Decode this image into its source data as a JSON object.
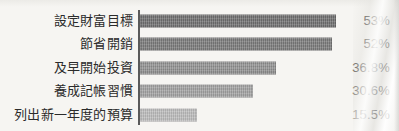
{
  "chart_data": {
    "type": "bar",
    "orientation": "horizontal",
    "title": "",
    "subtitle": "",
    "xlabel": "",
    "ylabel": "",
    "grid": false,
    "legend": null,
    "xlim": [
      0,
      55
    ],
    "axis_line": "vertical baseline at zero",
    "categories": [
      "設定財富目標",
      "節省開銷",
      "及早開始投資",
      "養成記帳習慣",
      "列出新一年度的預算"
    ],
    "values": [
      53,
      52,
      36.8,
      30.6,
      15.5
    ],
    "value_labels": [
      "53%",
      "52%",
      "36.8%",
      "30.6%",
      "15.5%"
    ],
    "bar_colors": [
      "#6f6f6f",
      "#7b7b7b",
      "#8e8e8e",
      "#a2a2a2",
      "#bcbcbc"
    ],
    "bars": [
      {
        "category": "設定財富目標",
        "value": 53,
        "value_label": "53%",
        "color": "#6f6f6f"
      },
      {
        "category": "節省開銷",
        "value": 52,
        "value_label": "52%",
        "color": "#7b7b7b"
      },
      {
        "category": "及早開始投資",
        "value": 36.8,
        "value_label": "36.8%",
        "color": "#8e8e8e"
      },
      {
        "category": "養成記帳習慣",
        "value": 30.6,
        "value_label": "30.6%",
        "color": "#a2a2a2"
      },
      {
        "category": "列出新一年度的預算",
        "value": 15.5,
        "value_label": "15.5%",
        "color": "#bcbcbc"
      }
    ]
  },
  "style": {
    "background": "#f6f5f2",
    "text_color": "#2b2b2b",
    "axis_color": "#5a5a5a"
  }
}
